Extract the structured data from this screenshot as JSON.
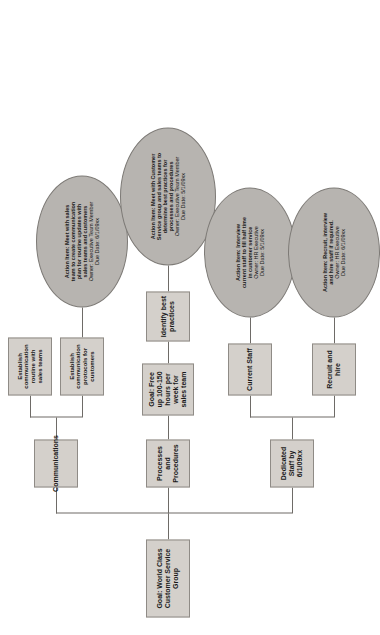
{
  "diagram": {
    "root": {
      "label": "Goal: World Class Customer Service Group"
    },
    "branches": [
      {
        "key": "dedicated-staff",
        "label": "Dedicated Staff by 6/1/09xx",
        "children": [
          {
            "key": "current-staff",
            "label": "Current Staff",
            "action": {
              "lines": [
                "Action Item: Interview",
                "current staff to fill half time",
                "in customer service",
                "Owner:  HR Executive",
                "Due Date: 5/1/09xx"
              ]
            }
          },
          {
            "key": "recruit-and-hire",
            "label": "Recruit and hire",
            "action": {
              "lines": [
                "Action Item: Recruit, interview",
                "and hire staff if required.",
                "Owner: HR Executive",
                "Due Date: 6/1/09xx"
              ]
            }
          }
        ]
      },
      {
        "key": "processes-and-procedures",
        "label": "Processes and Procedures",
        "subgoal": "Goal: Free up 100-150 hours per week for sales team",
        "children": [
          {
            "key": "identify-best-practices",
            "label": "Identify best practices",
            "action": {
              "lines": [
                "Action Item: Meet with Customer",
                "Service group and sales teams to",
                "determine best practices for",
                "processes and procedures",
                "Owner:  Executive Team Member",
                "Due Date: 5/1/09xx"
              ]
            }
          }
        ]
      },
      {
        "key": "communications",
        "label": "Communications",
        "children": [
          {
            "key": "establish-routine",
            "label": "Establish communication routine with sales teams",
            "action": null
          },
          {
            "key": "establish-protocols",
            "label": "Establish communication protocols for customers",
            "action": {
              "lines": [
                "Action Item:  Meet with sales",
                "team to create communication",
                "plan for routine updates with",
                "sales teams and customers",
                "Owner:  Executive Team Member",
                "Due Date: 6/1/09xx"
              ]
            }
          }
        ]
      }
    ],
    "colors": {
      "box_fill": "#d4d0cb",
      "box_border": "#8f8b86",
      "ellipse_fill": "#b7b4b0",
      "ellipse_border": "#7d7a76",
      "line": "#6e6b67",
      "text": "#1a1a1a"
    }
  }
}
